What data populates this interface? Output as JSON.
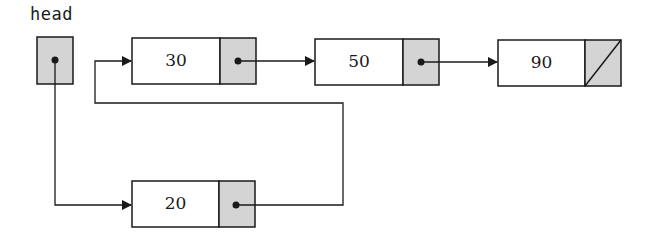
{
  "diagram": {
    "type": "linked-list",
    "head_label": "head",
    "colors": {
      "line": "#1a1a1a",
      "pointer_fill": "#d4d4d4",
      "value_fill": "#ffffff"
    },
    "nodes": [
      {
        "id": "n30",
        "value": "30",
        "next": "n50"
      },
      {
        "id": "n50",
        "value": "50",
        "next": "n90"
      },
      {
        "id": "n90",
        "value": "90",
        "next": null
      },
      {
        "id": "n20",
        "value": "20",
        "next": "n30"
      }
    ],
    "head_points_to": "n20",
    "order_from_head": [
      "20",
      "30",
      "50",
      "90"
    ]
  }
}
